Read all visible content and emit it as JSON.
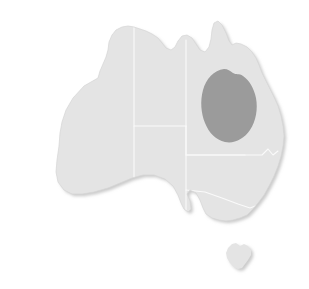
{
  "figure": {
    "type": "choropleth-locator-map",
    "background_color": "#ffffff",
    "width": 309,
    "height": 289
  },
  "colors": {
    "land": "#e4e4e4",
    "state_border": "#fafafa",
    "coast_outline": "#d6d6d6",
    "highlight": "#9b9b9b",
    "shadow": "#d2d2d2",
    "background": "#ffffff"
  },
  "regions": [
    {
      "id": "western-australia",
      "name": "Western Australia",
      "shaded": false,
      "fill": "#e4e4e4"
    },
    {
      "id": "northern-territory",
      "name": "Northern Territory",
      "shaded": false,
      "fill": "#e4e4e4"
    },
    {
      "id": "south-australia",
      "name": "South Australia",
      "shaded": false,
      "fill": "#e4e4e4"
    },
    {
      "id": "queensland",
      "name": "Queensland",
      "shaded": false,
      "fill": "#e4e4e4"
    },
    {
      "id": "new-south-wales",
      "name": "New South Wales",
      "shaded": false,
      "fill": "#e4e4e4"
    },
    {
      "id": "victoria",
      "name": "Victoria",
      "shaded": false,
      "fill": "#e4e4e4"
    },
    {
      "id": "tasmania",
      "name": "Tasmania",
      "shaded": false,
      "fill": "#e4e4e4"
    }
  ],
  "highlight": {
    "id": "highlight-blob",
    "name": "Highlighted area in central Queensland",
    "located_in": "queensland",
    "fill": "#9b9b9b",
    "shape": "ellipse-blob",
    "center_x": 229,
    "center_y": 104,
    "radius_x": 28,
    "radius_y": 36
  },
  "labels": {
    "visible_text": []
  },
  "effects": {
    "drop_shadow": true,
    "shadow_offset_x": 2,
    "shadow_offset_y": 2
  }
}
